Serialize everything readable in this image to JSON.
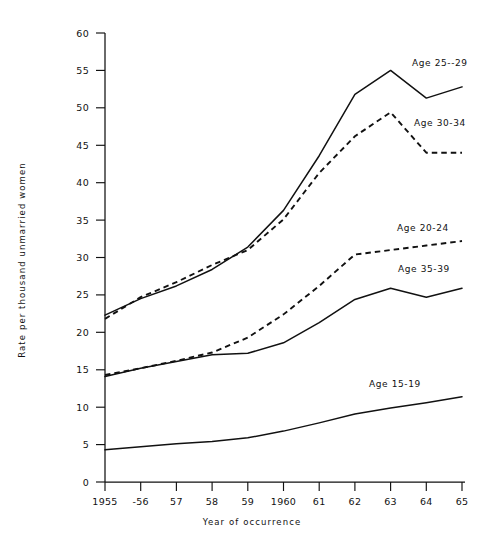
{
  "page": {
    "top_partial_text": "",
    "background": "#ffffff",
    "ink": "#111111"
  },
  "axes": {
    "y_title": "Rate per thousand unmarried women",
    "x_title": "Year of occurrence",
    "y_ticks": [
      "0",
      "5",
      "10",
      "15",
      "20",
      "25",
      "30",
      "35",
      "40",
      "45",
      "50",
      "55",
      "60"
    ],
    "x_ticks": [
      "1955",
      "-56",
      "57",
      "58",
      "59",
      "1960",
      "61",
      "62",
      "63",
      "64",
      "65"
    ]
  },
  "labels": {
    "age_25_29": "Age  25--29",
    "age_30_34": "Age  30-34",
    "age_20_24": "Age  20-24",
    "age_35_39": "Age  35-39",
    "age_15_19": "Age  15-19"
  },
  "chart_data": {
    "type": "line",
    "title": "",
    "xlabel": "Year of occurrence",
    "ylabel": "Rate per thousand unmarried women",
    "xlim": [
      1955,
      1965
    ],
    "ylim": [
      0,
      60
    ],
    "ytick_step": 5,
    "grid": false,
    "legend": "inline-annotations",
    "x": [
      1955,
      1956,
      1957,
      1958,
      1959,
      1960,
      1961,
      1962,
      1963,
      1964,
      1965
    ],
    "categories": [
      "1955",
      "-56",
      "57",
      "58",
      "59",
      "1960",
      "61",
      "62",
      "63",
      "64",
      "65"
    ],
    "series": [
      {
        "name": "Age 25-29",
        "label": "Age  25--29",
        "style": "solid",
        "color": "#111111",
        "values": [
          22.3,
          24.5,
          26.2,
          28.4,
          31.4,
          36.3,
          43.6,
          51.8,
          55.0,
          51.3,
          52.8
        ]
      },
      {
        "name": "Age 30-34",
        "label": "Age  30-34",
        "style": "dashed",
        "color": "#111111",
        "values": [
          21.8,
          24.7,
          26.7,
          29.0,
          31.0,
          35.1,
          41.3,
          46.2,
          49.4,
          44.0,
          44.0
        ]
      },
      {
        "name": "Age 20-24",
        "label": "Age  20-24",
        "style": "dashed",
        "color": "#111111",
        "values": [
          14.3,
          15.2,
          16.2,
          17.3,
          19.3,
          22.4,
          26.2,
          30.4,
          31.0,
          31.6,
          32.2
        ]
      },
      {
        "name": "Age 35-39",
        "label": "Age  35-39",
        "style": "solid",
        "color": "#111111",
        "values": [
          14.1,
          15.2,
          16.1,
          17.0,
          17.2,
          18.6,
          21.3,
          24.4,
          25.9,
          24.7,
          25.9
        ]
      },
      {
        "name": "Age 15-19",
        "label": "Age  15-19",
        "style": "solid",
        "color": "#111111",
        "values": [
          4.3,
          4.7,
          5.1,
          5.4,
          5.9,
          6.8,
          7.9,
          9.1,
          9.9,
          10.6,
          11.4
        ]
      }
    ]
  }
}
